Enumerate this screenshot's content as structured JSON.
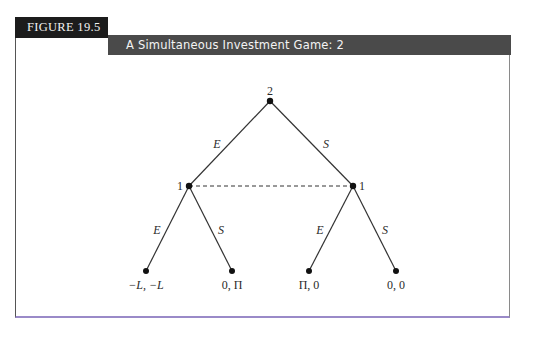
{
  "figure": {
    "label": "FIGURE 19.5",
    "title": "A Simultaneous Investment Game: 2"
  },
  "colors": {
    "label_bg": "#1c1c1c",
    "title_bg": "#4a4a4a",
    "line": "#333333"
  },
  "tree": {
    "root": {
      "player": "2",
      "x": 270,
      "y": 101
    },
    "decision_nodes": [
      {
        "player": "1",
        "x": 189,
        "y": 186
      },
      {
        "player": "1",
        "x": 353,
        "y": 186
      }
    ],
    "information_set": "dashed line connecting both player 1 nodes",
    "root_edges": [
      {
        "label": "E",
        "to": 0
      },
      {
        "label": "S",
        "to": 1
      }
    ],
    "lower_edges": [
      {
        "label": "E",
        "from": 0
      },
      {
        "label": "S",
        "from": 0
      },
      {
        "label": "E",
        "from": 1
      },
      {
        "label": "S",
        "from": 1
      }
    ],
    "leaves": [
      {
        "payoff": "−L, −L",
        "x": 146,
        "y": 271
      },
      {
        "payoff": "0, Π",
        "x": 232,
        "y": 271
      },
      {
        "payoff": "Π, 0",
        "x": 309,
        "y": 271
      },
      {
        "payoff": "0, 0",
        "x": 396,
        "y": 271
      }
    ]
  }
}
